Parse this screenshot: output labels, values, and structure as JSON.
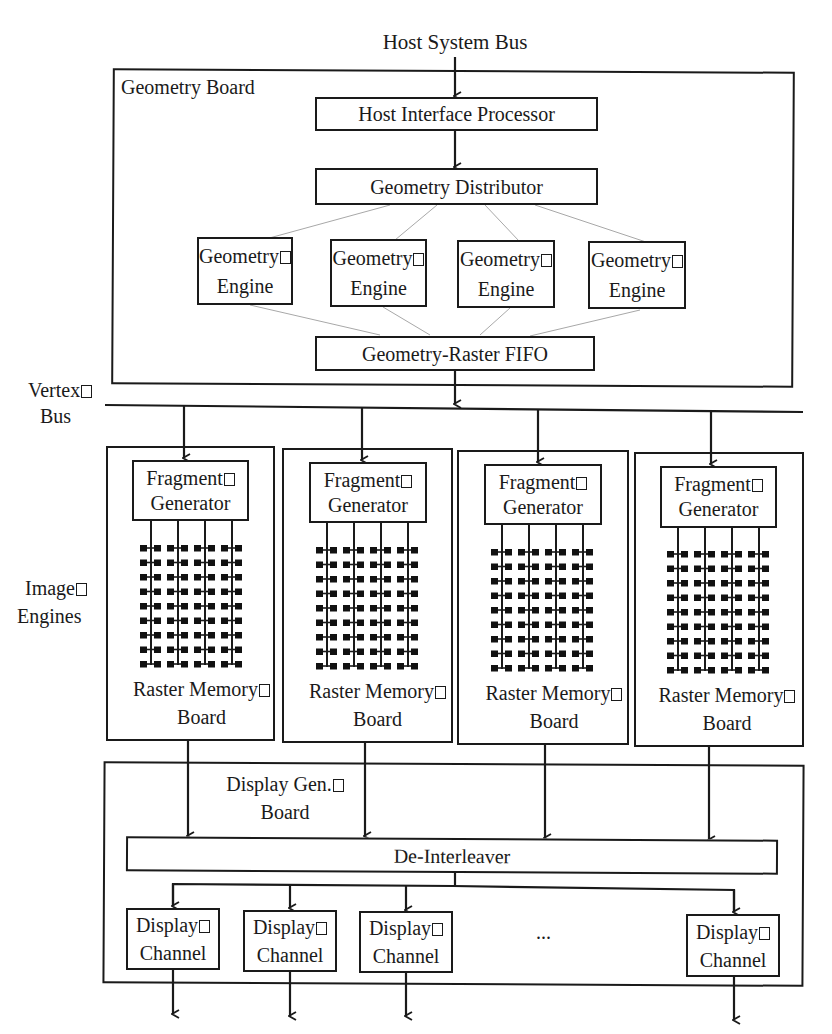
{
  "diagram": {
    "host_bus_label": "Host System Bus",
    "geometry_board": {
      "label": "Geometry Board",
      "host_interface": "Host Interface Processor",
      "distributor": "Geometry Distributor",
      "engines": [
        {
          "line1": "Geometry",
          "line2": "Engine"
        },
        {
          "line1": "Geometry",
          "line2": "Engine"
        },
        {
          "line1": "Geometry",
          "line2": "Engine"
        },
        {
          "line1": "Geometry",
          "line2": "Engine"
        }
      ],
      "fifo": "Geometry-Raster FIFO"
    },
    "vertex_bus": {
      "line1": "Vertex",
      "line2": "Bus"
    },
    "image_engines_label": {
      "line1": "Image",
      "line2": "Engines"
    },
    "raster_boards": [
      {
        "fragment_line1": "Fragment",
        "fragment_line2": "Generator",
        "board_line1": "Raster Memory",
        "board_line2": "Board"
      },
      {
        "fragment_line1": "Fragment",
        "fragment_line2": "Generator",
        "board_line1": "Raster Memory",
        "board_line2": "Board"
      },
      {
        "fragment_line1": "Fragment",
        "fragment_line2": "Generator",
        "board_line1": "Raster Memory",
        "board_line2": "Board"
      },
      {
        "fragment_line1": "Fragment",
        "fragment_line2": "Generator",
        "board_line1": "Raster Memory",
        "board_line2": "Board"
      }
    ],
    "image_engine_grid": {
      "rows": 9,
      "columns": 4,
      "chips_per_row_per_column": 2
    },
    "display_board": {
      "label_line1": "Display Gen.",
      "label_line2": "Board",
      "deinterleaver": "De-Interleaver",
      "channels": [
        {
          "line1": "Display",
          "line2": "Channel"
        },
        {
          "line1": "Display",
          "line2": "Channel"
        },
        {
          "line1": "Display",
          "line2": "Channel"
        },
        {
          "line1": "Display",
          "line2": "Channel"
        }
      ],
      "ellipsis": "..."
    },
    "colors": {
      "ink": "#1a1a1a",
      "thin_line": "#a0a0a0",
      "background": "#ffffff"
    }
  }
}
